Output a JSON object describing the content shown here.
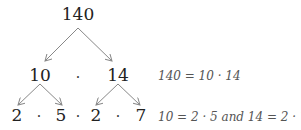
{
  "tree": {
    "root": "140",
    "level1": {
      "left": "10",
      "right": "14"
    },
    "level2": [
      "2",
      "5",
      "2",
      "7"
    ],
    "dot": "·"
  },
  "equations": {
    "eq1": "140 = 10 · 14",
    "eq2": "10 = 2 · 5 and 14 = 2 · 7"
  },
  "colors": {
    "arrow": "#888888",
    "text": "#222222",
    "equation": "#555555"
  }
}
